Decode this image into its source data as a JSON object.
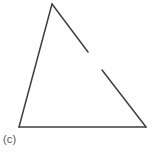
{
  "figure": {
    "caption": "(c)",
    "background_color": "#ffffff",
    "stroke_color": "#3f3f3f",
    "stroke_width": 1.5,
    "canvas": {
      "width": 157,
      "height": 153
    }
  },
  "chart_data": {
    "type": "diagram",
    "title": "",
    "shape": "triangle",
    "closed": false,
    "vertices": [
      {
        "name": "apex",
        "x": 52,
        "y": 4
      },
      {
        "name": "bottom-right",
        "x": 146,
        "y": 127
      },
      {
        "name": "bottom-left",
        "x": 19,
        "y": 127
      }
    ],
    "segments": [
      {
        "name": "left-edge",
        "from": {
          "x": 52,
          "y": 4
        },
        "to": {
          "x": 19,
          "y": 127
        }
      },
      {
        "name": "bottom-edge",
        "from": {
          "x": 19,
          "y": 127
        },
        "to": {
          "x": 146,
          "y": 127
        }
      },
      {
        "name": "right-edge-upper",
        "from": {
          "x": 52,
          "y": 4
        },
        "to": {
          "x": 88,
          "y": 52
        }
      },
      {
        "name": "right-edge-lower",
        "from": {
          "x": 102,
          "y": 70
        },
        "to": {
          "x": 146,
          "y": 127
        }
      }
    ],
    "gap": {
      "on_segment": "right-edge",
      "from": {
        "x": 88,
        "y": 52
      },
      "to": {
        "x": 102,
        "y": 70
      }
    }
  }
}
